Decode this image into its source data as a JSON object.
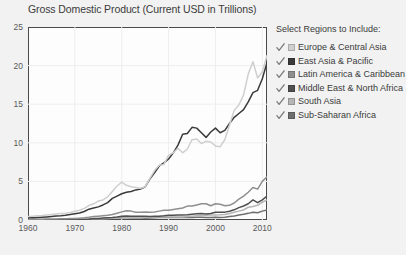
{
  "chart_data": {
    "type": "line",
    "title": "Gross Domestic Product (Current USD in Trillions)",
    "xlabel": "",
    "ylabel": "",
    "xlim": [
      1960,
      2011
    ],
    "ylim": [
      0,
      25
    ],
    "grid": true,
    "legend_position": "right",
    "y_ticks": [
      0,
      5,
      10,
      15,
      20,
      25
    ],
    "x_ticks": [
      1960,
      1970,
      1980,
      1990,
      2000,
      2010
    ],
    "x": [
      1960,
      1961,
      1962,
      1963,
      1964,
      1965,
      1966,
      1967,
      1968,
      1969,
      1970,
      1971,
      1972,
      1973,
      1974,
      1975,
      1976,
      1977,
      1978,
      1979,
      1980,
      1981,
      1982,
      1983,
      1984,
      1985,
      1986,
      1987,
      1988,
      1989,
      1990,
      1991,
      1992,
      1993,
      1994,
      1995,
      1996,
      1997,
      1998,
      1999,
      2000,
      2001,
      2002,
      2003,
      2004,
      2005,
      2006,
      2007,
      2008,
      2009,
      2010,
      2011
    ],
    "series": [
      {
        "name": "Europe & Central Asia",
        "color": "#cfcfcf",
        "values": [
          0.45,
          0.49,
          0.54,
          0.59,
          0.66,
          0.72,
          0.78,
          0.84,
          0.88,
          0.98,
          1.12,
          1.26,
          1.5,
          1.87,
          2.1,
          2.45,
          2.6,
          3.0,
          3.7,
          4.4,
          4.9,
          4.5,
          4.3,
          4.2,
          4.1,
          4.3,
          5.4,
          6.4,
          7.1,
          7.2,
          8.4,
          8.7,
          9.3,
          8.7,
          9.2,
          10.4,
          10.5,
          9.9,
          10.2,
          10.1,
          9.6,
          9.5,
          10.4,
          12.3,
          14.2,
          14.9,
          16.2,
          18.9,
          20.5,
          18.4,
          19.2,
          21.3
        ]
      },
      {
        "name": "East Asia & Pacific",
        "color": "#3a3a3a",
        "values": [
          0.28,
          0.3,
          0.33,
          0.36,
          0.4,
          0.45,
          0.51,
          0.56,
          0.63,
          0.72,
          0.82,
          0.9,
          1.1,
          1.4,
          1.55,
          1.7,
          1.95,
          2.25,
          2.8,
          3.1,
          3.4,
          3.6,
          3.7,
          3.9,
          4.0,
          4.3,
          5.3,
          6.1,
          7.0,
          7.4,
          7.9,
          8.7,
          9.7,
          11.1,
          11.2,
          12.0,
          11.9,
          11.3,
          10.7,
          11.4,
          11.9,
          11.3,
          11.6,
          12.5,
          13.3,
          13.8,
          14.3,
          15.3,
          16.5,
          16.8,
          18.3,
          20.4
        ]
      },
      {
        "name": "Latin America & Caribbean",
        "color": "#8f8f8f",
        "values": [
          0.08,
          0.09,
          0.09,
          0.1,
          0.12,
          0.13,
          0.14,
          0.15,
          0.17,
          0.19,
          0.21,
          0.24,
          0.28,
          0.35,
          0.44,
          0.5,
          0.56,
          0.63,
          0.72,
          0.88,
          1.05,
          1.2,
          1.15,
          1.0,
          1.0,
          1.05,
          1.0,
          1.05,
          1.15,
          1.25,
          1.25,
          1.35,
          1.45,
          1.55,
          1.8,
          1.8,
          1.95,
          2.1,
          2.1,
          1.85,
          2.1,
          2.05,
          1.85,
          1.9,
          2.2,
          2.7,
          3.1,
          3.6,
          4.2,
          4.0,
          5.0,
          5.6
        ]
      },
      {
        "name": "Middle East & North Africa",
        "color": "#4f4f4f",
        "values": [
          0.02,
          0.02,
          0.02,
          0.02,
          0.03,
          0.03,
          0.03,
          0.04,
          0.04,
          0.05,
          0.05,
          0.07,
          0.08,
          0.11,
          0.19,
          0.21,
          0.26,
          0.3,
          0.32,
          0.4,
          0.5,
          0.52,
          0.5,
          0.5,
          0.5,
          0.5,
          0.45,
          0.48,
          0.5,
          0.54,
          0.62,
          0.6,
          0.65,
          0.66,
          0.68,
          0.75,
          0.82,
          0.85,
          0.78,
          0.85,
          1.0,
          1.0,
          1.02,
          1.14,
          1.32,
          1.6,
          1.82,
          2.1,
          2.6,
          2.25,
          2.6,
          3.1
        ]
      },
      {
        "name": "South Asia",
        "color": "#b5b5b5",
        "values": [
          0.05,
          0.05,
          0.05,
          0.06,
          0.07,
          0.07,
          0.07,
          0.08,
          0.08,
          0.09,
          0.1,
          0.1,
          0.11,
          0.13,
          0.15,
          0.16,
          0.16,
          0.19,
          0.22,
          0.24,
          0.26,
          0.28,
          0.28,
          0.3,
          0.3,
          0.32,
          0.34,
          0.38,
          0.4,
          0.4,
          0.43,
          0.38,
          0.4,
          0.4,
          0.46,
          0.5,
          0.55,
          0.58,
          0.6,
          0.64,
          0.66,
          0.68,
          0.72,
          0.85,
          1.0,
          1.15,
          1.3,
          1.65,
          1.75,
          1.9,
          2.3,
          2.6
        ]
      },
      {
        "name": "Sub-Saharan Africa",
        "color": "#6e6e6e",
        "values": [
          0.03,
          0.03,
          0.03,
          0.04,
          0.04,
          0.04,
          0.05,
          0.05,
          0.05,
          0.06,
          0.07,
          0.07,
          0.08,
          0.1,
          0.13,
          0.15,
          0.16,
          0.18,
          0.2,
          0.24,
          0.29,
          0.29,
          0.27,
          0.26,
          0.25,
          0.24,
          0.26,
          0.29,
          0.31,
          0.32,
          0.34,
          0.34,
          0.34,
          0.32,
          0.31,
          0.34,
          0.35,
          0.36,
          0.34,
          0.34,
          0.35,
          0.34,
          0.35,
          0.44,
          0.53,
          0.64,
          0.74,
          0.86,
          1.0,
          0.95,
          1.15,
          1.3
        ]
      }
    ]
  },
  "legend": {
    "title": "Select Regions to Include:",
    "items": [
      {
        "label": "Europe & Central Asia",
        "color": "#cfcfcf",
        "checked": true
      },
      {
        "label": "East Asia & Pacific",
        "color": "#3a3a3a",
        "checked": true
      },
      {
        "label": "Latin America & Caribbean",
        "color": "#8f8f8f",
        "checked": true
      },
      {
        "label": "Middle East & North Africa",
        "color": "#4f4f4f",
        "checked": true
      },
      {
        "label": "South Asia",
        "color": "#b5b5b5",
        "checked": true
      },
      {
        "label": "Sub-Saharan Africa",
        "color": "#6e6e6e",
        "checked": true
      }
    ]
  },
  "caption": {
    "text": ""
  }
}
